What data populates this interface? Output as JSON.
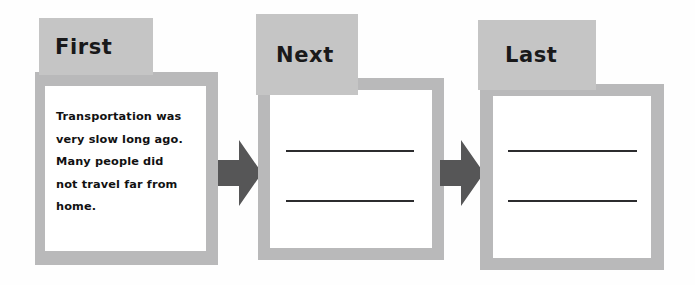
{
  "worksheet": {
    "title": "Sequence graphic organizer",
    "colors": {
      "tab_gray": "#c5c5c5",
      "frame_gray": "#b9b9ba",
      "card_white": "#ffffff",
      "arrow_gray": "#565657",
      "text_black": "#111112",
      "line_black": "#2c2c2e",
      "page_background": "#fefefe"
    },
    "cards": [
      {
        "id": "first",
        "tab_label": "First",
        "body_text": "Transportation was\nvery slow long ago.\nMany people did\nnot travel far from\nhome.",
        "lines": 0
      },
      {
        "id": "next",
        "tab_label": "Next",
        "body_text": "",
        "lines": 2
      },
      {
        "id": "last",
        "tab_label": "Last",
        "body_text": "",
        "lines": 2
      }
    ],
    "arrows": [
      {
        "id": "arrow-first-to-next",
        "name": "right-arrow-icon"
      },
      {
        "id": "arrow-next-to-last",
        "name": "right-arrow-icon"
      }
    ]
  }
}
